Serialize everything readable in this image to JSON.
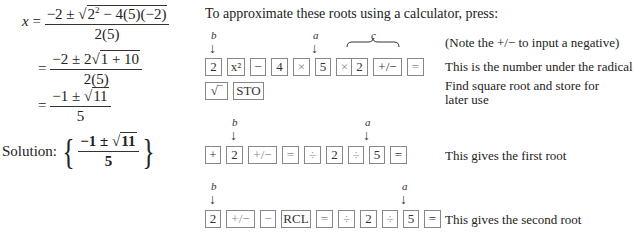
{
  "derivation": {
    "line1": {
      "lhs": "x",
      "num": "−2 ± ",
      "rad": "2² − 4(5)(−2)",
      "den": "2(5)"
    },
    "line2": {
      "eq": "=",
      "num": "−2 ± 2",
      "rad": "1 + 10",
      "den": "2(5)"
    },
    "line3": {
      "eq": "=",
      "num": "−1 ± ",
      "rad": "11",
      "den": "5"
    },
    "solution": {
      "label": "Solution:",
      "num": "−1 ± ",
      "rad": "11",
      "den": "5"
    }
  },
  "intro": "To approximate these roots using a calculator, press:",
  "labels": {
    "b": "b",
    "a": "a",
    "c": "c"
  },
  "rows": [
    {
      "keys": [
        "2",
        "x²",
        "−",
        "4",
        "×",
        "5",
        "×",
        "2",
        "+/−",
        "="
      ],
      "note1": "(Note the +/− to input a negative)",
      "note2": "This is the number under the radical"
    },
    {
      "keys": [
        "√‾",
        "STO"
      ],
      "note": "Find square root and store for later use"
    },
    {
      "keys": [
        "+",
        "2",
        "+/−",
        "=",
        "÷",
        "2",
        "÷",
        "5",
        "="
      ],
      "note": "This gives the first root"
    },
    {
      "keys": [
        "2",
        "+/−",
        "−",
        "RCL",
        "=",
        "÷",
        "2",
        "÷",
        "5",
        "="
      ],
      "note": "This gives the second root"
    }
  ]
}
